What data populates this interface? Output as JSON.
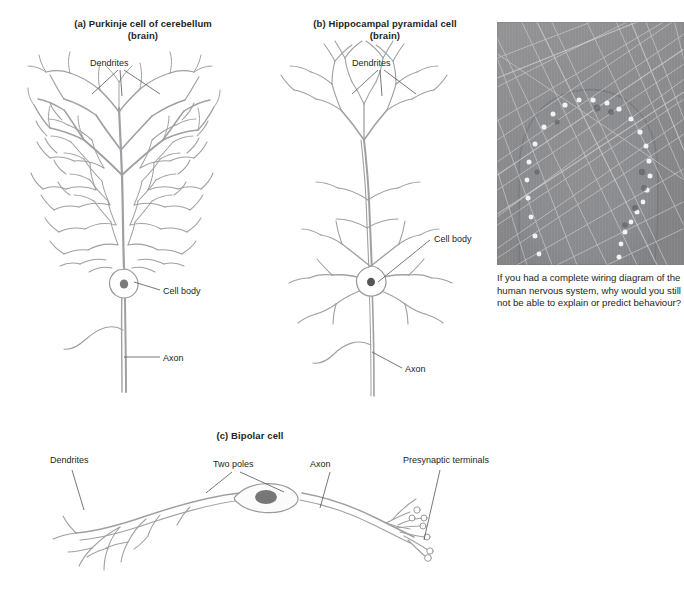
{
  "figure": {
    "background": "#ffffff",
    "line_color": "#9a9a9e",
    "text_color": "#231f20"
  },
  "panels": {
    "a": {
      "title_line1": "(a) Purkinje cell of cerebellum",
      "title_line2": "(brain)",
      "labels": {
        "dendrites": "Dendrites",
        "cell_body": "Cell body",
        "axon": "Axon"
      }
    },
    "b": {
      "title_line1": "(b) Hippocampal pyramidal cell",
      "title_line2": "(brain)",
      "labels": {
        "dendrites": "Dendrites",
        "cell_body": "Cell body",
        "axon": "Axon"
      }
    },
    "c": {
      "title": "(c) Bipolar cell",
      "labels": {
        "dendrites": "Dendrites",
        "two_poles": "Two poles",
        "axon": "Axon",
        "presynaptic_terminals": "Presynaptic terminals"
      }
    }
  },
  "photo": {
    "alt_name": "micrograph-neuron-synapses",
    "caption": "If you had a complete wiring diagram of the human nervous system, why would you still not be able to explain or predict behaviour?"
  }
}
